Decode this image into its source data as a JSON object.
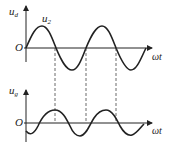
{
  "upper": {
    "y_label": "u",
    "y_label_sub": "d",
    "curve_label": "u",
    "curve_label_sub": "2",
    "origin_label": "O",
    "x_label": "ωt"
  },
  "lower": {
    "y_label": "u",
    "y_label_sub": "g",
    "origin_label": "O",
    "x_label": "ωt"
  },
  "colors": {
    "stroke": "#222222",
    "background": "#ffffff"
  }
}
